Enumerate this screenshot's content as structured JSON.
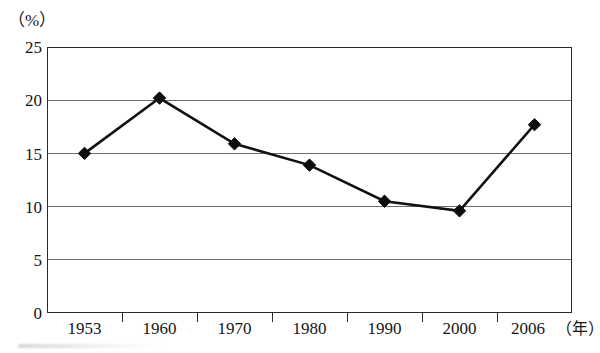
{
  "chart_data": {
    "type": "line",
    "title": "",
    "subtitle": "",
    "xlabel": "",
    "ylabel": "",
    "x_unit": "（年）",
    "y_unit": "（%）",
    "categories": [
      "1953",
      "1960",
      "1970",
      "1980",
      "1990",
      "2000",
      "2006"
    ],
    "values": [
      15.0,
      20.2,
      15.9,
      13.9,
      10.5,
      9.6,
      17.7
    ],
    "series": [
      {
        "name": "",
        "values": [
          15.0,
          20.2,
          15.9,
          13.9,
          10.5,
          9.6,
          17.7
        ]
      }
    ],
    "ylim": [
      0,
      25
    ],
    "yticks": [
      0,
      5,
      10,
      15,
      20,
      25
    ],
    "ytick_labels": [
      "0",
      "5",
      "10",
      "15",
      "20",
      "25"
    ],
    "grid": "horizontal",
    "legend": "none",
    "marker": "diamond",
    "line_color": "#111111",
    "marker_color": "#0d0d0d",
    "grid_color": "#6f6f6f",
    "frame_color": "#2a2a2a",
    "background": "#ffffff",
    "annotations": []
  },
  "axes": {
    "y_unit_label": "（%）",
    "x_unit_label": "（年）"
  }
}
